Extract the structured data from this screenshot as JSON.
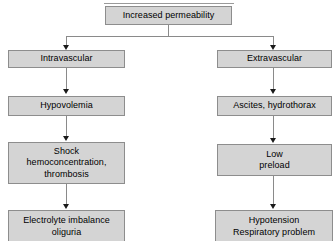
{
  "diagram": {
    "root": {
      "label": "Increased permeability"
    },
    "branches": [
      {
        "name": "intravascular",
        "nodes": [
          {
            "label": "Intravascular"
          },
          {
            "label": "Hypovolemia"
          },
          {
            "label": "Shock\nhemoconcentration,\nthrombosis"
          },
          {
            "label": "Electrolyte imbalance\noliguria"
          }
        ]
      },
      {
        "name": "extravascular",
        "nodes": [
          {
            "label": "Extravascular"
          },
          {
            "label": "Ascites, hydrothorax"
          },
          {
            "label": "Low\npreload"
          },
          {
            "label": "Hypotension\nRespiratory problem"
          }
        ]
      }
    ],
    "colors": {
      "node_fill": "#d4d4d4",
      "node_border": "#8d8d8d",
      "connector": "#8a8a8a",
      "arrow": "#1a1a1a",
      "text": "#000000",
      "background": "#ffffff"
    }
  }
}
